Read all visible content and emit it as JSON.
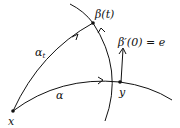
{
  "diagram": {
    "points": {
      "x": {
        "label": "x",
        "pos": [
          13,
          111
        ]
      },
      "y": {
        "label": "y",
        "pos": [
          120,
          82
        ]
      },
      "beta_t": {
        "label": "β(t)",
        "pos": [
          93,
          23
        ]
      }
    },
    "curves": {
      "alpha": {
        "label": "α"
      },
      "alpha_t": {
        "label": "α",
        "subscript": "t"
      },
      "beta": {
        "label": ""
      }
    },
    "vector": {
      "label": "β′(0) = e"
    }
  }
}
